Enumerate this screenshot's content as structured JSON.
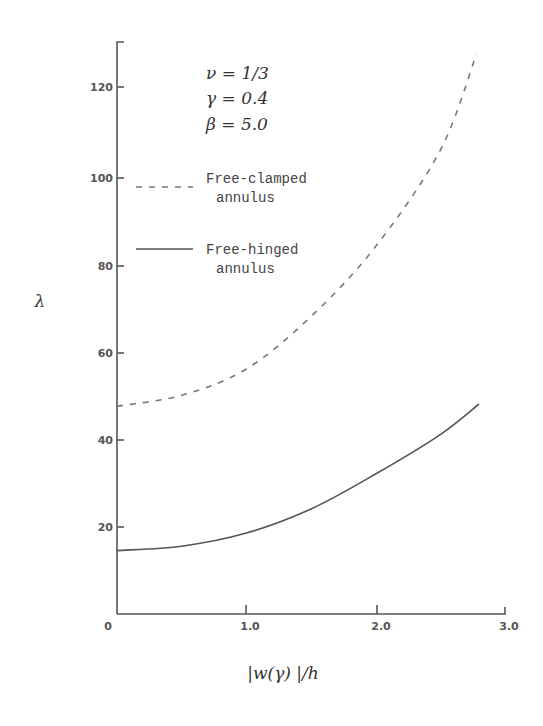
{
  "chart_data": {
    "type": "line",
    "title": "",
    "xlabel": "|w(γ)|/h",
    "ylabel": "λ",
    "xlim": [
      0,
      3.0
    ],
    "ylim": [
      0,
      130
    ],
    "x_ticks": [
      "0",
      "1.0",
      "2.0",
      "3.0"
    ],
    "y_ticks": [
      "20",
      "40",
      "60",
      "80",
      "100",
      "120"
    ],
    "grid": false,
    "legend_position": "upper-left inside",
    "annotations": [
      "ν = 1/3",
      "γ = 0.4",
      "β = 5.0"
    ],
    "series": [
      {
        "name": "Free-clamped annulus",
        "style": "dashed",
        "x": [
          0,
          0.5,
          1.0,
          1.5,
          2.0,
          2.5,
          2.78
        ],
        "values": [
          47.5,
          50,
          56,
          68,
          84,
          106,
          128
        ]
      },
      {
        "name": "Free-hinged annulus",
        "style": "solid",
        "x": [
          0,
          0.5,
          1.0,
          1.5,
          2.0,
          2.5,
          2.8
        ],
        "values": [
          14.5,
          15.5,
          18.5,
          24,
          32,
          41,
          48
        ]
      }
    ]
  },
  "labels": {
    "params": [
      "ν = 1/3",
      "γ = 0.4",
      "β = 5.0"
    ],
    "legend_clamped_line1": "Free-clamped",
    "legend_clamped_line2": "annulus",
    "legend_hinged_line1": "Free-hinged",
    "legend_hinged_line2": "annulus",
    "ylabel": "λ",
    "xlabel": "|w(γ) |/h",
    "x_tick_0": "0",
    "x_tick_1": "1.0",
    "x_tick_2": "2.0",
    "x_tick_3": "3.0",
    "y_tick_20": "20",
    "y_tick_40": "40",
    "y_tick_60": "60",
    "y_tick_80": "80",
    "y_tick_100": "100",
    "y_tick_120": "120"
  }
}
